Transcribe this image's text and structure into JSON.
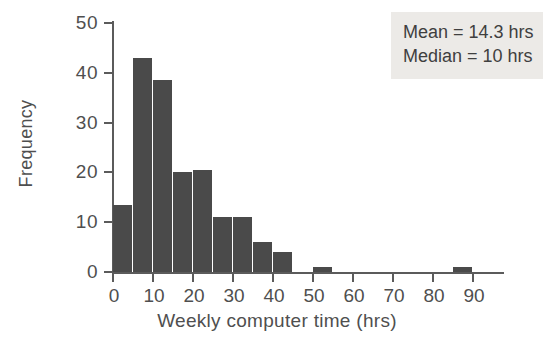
{
  "chart_data": {
    "type": "bar",
    "title": "",
    "subtitle": "",
    "xlabel": "Weekly computer time (hrs)",
    "ylabel": "Frequency",
    "xlim": [
      0,
      90
    ],
    "ylim": [
      0,
      50
    ],
    "bin_width": 5,
    "grid": false,
    "legend": null,
    "bar_color": "#4a4a4a",
    "axis_color": "#5b5b5b",
    "text_color": "#4f4f4f",
    "x_ticks": [
      0,
      10,
      20,
      30,
      40,
      50,
      60,
      70,
      80,
      90
    ],
    "x_tick_labels": [
      "0",
      "10",
      "20",
      "30",
      "40",
      "50",
      "60",
      "70",
      "80",
      "90"
    ],
    "y_ticks": [
      0,
      10,
      20,
      30,
      40,
      50
    ],
    "y_tick_labels": [
      "0",
      "10",
      "20",
      "30",
      "40",
      "50"
    ],
    "categories": [
      "0-5",
      "5-10",
      "10-15",
      "15-20",
      "20-25",
      "25-30",
      "30-35",
      "35-40",
      "40-45",
      "45-50",
      "50-55",
      "55-60",
      "60-65",
      "65-70",
      "70-75",
      "75-80",
      "80-85",
      "85-90"
    ],
    "bin_starts": [
      0,
      5,
      10,
      15,
      20,
      25,
      30,
      35,
      40,
      45,
      50,
      55,
      60,
      65,
      70,
      75,
      80,
      85
    ],
    "values": [
      13.5,
      43,
      38.5,
      20,
      20.5,
      11,
      11,
      6,
      4,
      0,
      1,
      0,
      0,
      0,
      0,
      0,
      0,
      1
    ],
    "annotations": [
      {
        "label": "Mean",
        "value": "14.3",
        "unit": "hrs",
        "text": "Mean = 14.3 hrs"
      },
      {
        "label": "Median",
        "value": "10",
        "unit": "hrs",
        "text": "Median = 10 hrs"
      }
    ]
  },
  "stats_box": {
    "background_color": "#eceae7",
    "lines": [
      "Mean = 14.3 hrs",
      "Median = 10 hrs"
    ]
  }
}
